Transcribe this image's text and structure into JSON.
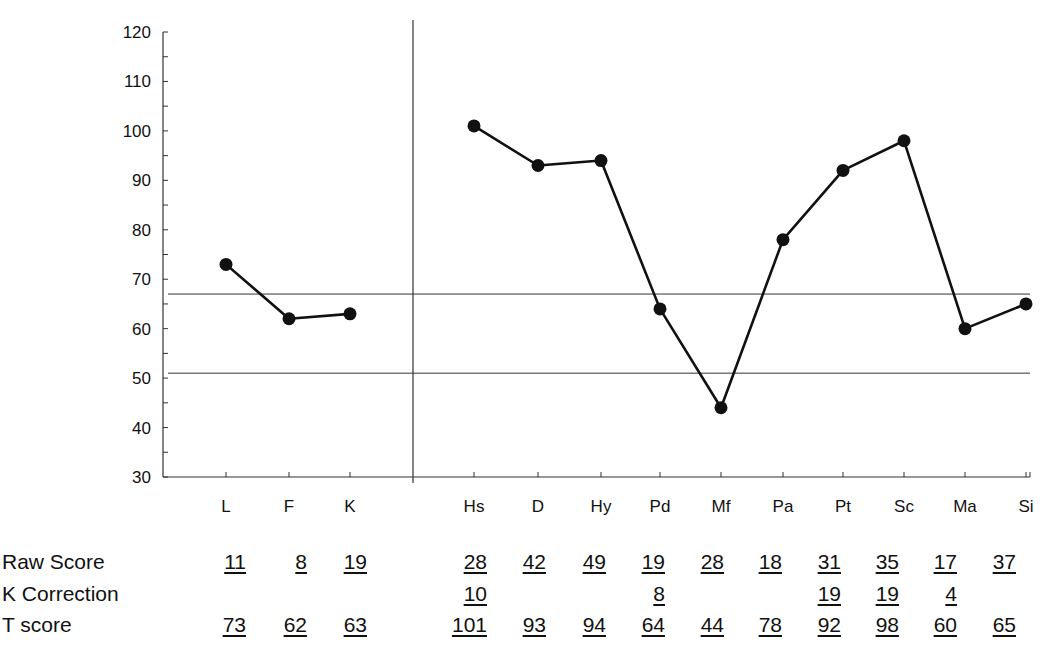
{
  "chart_data": {
    "type": "line",
    "title": "",
    "xlabel": "",
    "ylabel": "",
    "ylim": [
      30,
      120
    ],
    "yticks": [
      30,
      40,
      50,
      60,
      70,
      80,
      90,
      100,
      110,
      120
    ],
    "grid": false,
    "reference_lines": [
      67,
      51
    ],
    "groups": [
      {
        "name": "validity",
        "categories": [
          "L",
          "F",
          "K"
        ],
        "values": [
          73,
          62,
          63
        ]
      },
      {
        "name": "clinical",
        "categories": [
          "Hs",
          "D",
          "Hy",
          "Pd",
          "Mf",
          "Pa",
          "Pt",
          "Sc",
          "Ma",
          "Si"
        ],
        "values": [
          101,
          93,
          94,
          64,
          44,
          78,
          92,
          98,
          60,
          65
        ]
      }
    ],
    "table": {
      "row_labels": [
        "Raw Score",
        "K Correction",
        "T score"
      ],
      "columns": [
        "L",
        "F",
        "K",
        "Hs",
        "D",
        "Hy",
        "Pd",
        "Mf",
        "Pa",
        "Pt",
        "Sc",
        "Ma",
        "Si"
      ],
      "raw_score": [
        "11",
        "8",
        "19",
        "28",
        "42",
        "49",
        "19",
        "28",
        "18",
        "31",
        "35",
        "17",
        "37"
      ],
      "k_correction": [
        "",
        "",
        "",
        "10",
        "",
        "",
        "8",
        "",
        "",
        "19",
        "19",
        "4",
        ""
      ],
      "t_score": [
        "73",
        "62",
        "63",
        "101",
        "93",
        "94",
        "64",
        "44",
        "78",
        "92",
        "98",
        "60",
        "65"
      ]
    }
  },
  "colors": {
    "line": "#111111",
    "axis": "#333333",
    "marker": "#111111"
  }
}
